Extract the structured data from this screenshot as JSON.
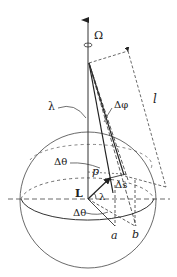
{
  "diagram": {
    "title": "",
    "labels": {
      "omega": "Ω",
      "lambda_top": "λ",
      "delta_phi": "Δφ",
      "length": "l",
      "delta_theta_upper": "Δθ",
      "point_p": "p",
      "delta_s": "Δs",
      "L": "L",
      "lambda_bottom": "λ",
      "delta_theta_lower": "Δθ",
      "point_a": "a",
      "point_b": "b"
    },
    "colors": {
      "stroke": "#333333",
      "background": "#ffffff"
    }
  }
}
